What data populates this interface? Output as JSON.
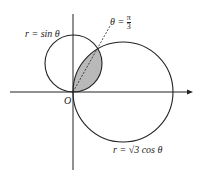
{
  "diagram": {
    "curves": [
      {
        "name": "r = sin θ",
        "label": "r = sin θ"
      },
      {
        "name": "r = √3 cos θ",
        "label": "r = √3 cos θ"
      }
    ],
    "ray": {
      "label_theta": "θ =",
      "label_num": "π",
      "label_den": "3"
    },
    "origin_label": "O",
    "colors": {
      "line": "#222222",
      "shade": "#b9b9b9"
    }
  }
}
